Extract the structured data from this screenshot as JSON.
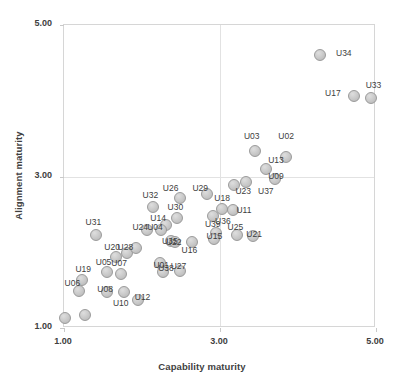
{
  "chart_data": {
    "type": "scatter",
    "title": "",
    "xlabel": "Capability maturity",
    "ylabel": "Alignment maturity",
    "xlim": [
      1.0,
      5.0
    ],
    "ylim": [
      1.0,
      5.0
    ],
    "xticks": [
      "1.00",
      "3.00",
      "5.00"
    ],
    "xtick_values": [
      1.0,
      3.0,
      5.0
    ],
    "yticks": [
      "1.00",
      "3.00",
      "5.00"
    ],
    "ytick_values": [
      1.0,
      3.0,
      5.0
    ],
    "grid": true,
    "legend": "none",
    "point_color": "#c9c9c9",
    "point_border_color": "#9a9a9a",
    "label_color": "#3d3d3d",
    "axis_color": "#d6d6d6",
    "points": [
      {
        "label": "U34",
        "x": 4.29,
        "y": 4.59,
        "lx": 4.6,
        "ly": 4.62
      },
      {
        "label": "U17",
        "x": 4.73,
        "y": 4.05,
        "lx": 4.46,
        "ly": 4.09
      },
      {
        "label": "U33",
        "x": 4.95,
        "y": 4.02,
        "lx": 4.98,
        "ly": 4.2
      },
      {
        "label": "U03",
        "x": 3.46,
        "y": 3.32,
        "lx": 3.42,
        "ly": 3.52
      },
      {
        "label": "U02",
        "x": 3.86,
        "y": 3.25,
        "lx": 3.86,
        "ly": 3.52
      },
      {
        "label": "U13",
        "x": 3.6,
        "y": 3.08,
        "lx": 3.73,
        "ly": 3.21
      },
      {
        "label": "U23",
        "x": 3.35,
        "y": 2.92,
        "lx": 3.31,
        "ly": 2.8
      },
      {
        "label": "U37",
        "x": 3.19,
        "y": 2.88,
        "lx": 3.6,
        "ly": 2.8
      },
      {
        "label": "U09",
        "x": 3.72,
        "y": 2.96,
        "lx": 3.73,
        "ly": 3.0
      },
      {
        "label": "U26",
        "x": 2.5,
        "y": 2.7,
        "lx": 2.38,
        "ly": 2.84
      },
      {
        "label": "U29",
        "x": 2.85,
        "y": 2.76,
        "lx": 2.76,
        "ly": 2.84
      },
      {
        "label": "U32",
        "x": 2.15,
        "y": 2.58,
        "lx": 2.12,
        "ly": 2.74
      },
      {
        "label": "U18",
        "x": 3.04,
        "y": 2.56,
        "lx": 3.04,
        "ly": 2.7
      },
      {
        "label": "U11",
        "x": 3.18,
        "y": 2.55,
        "lx": 3.32,
        "ly": 2.55
      },
      {
        "label": "U36",
        "x": 2.92,
        "y": 2.46,
        "lx": 3.05,
        "ly": 2.4
      },
      {
        "label": "U30",
        "x": 2.46,
        "y": 2.44,
        "lx": 2.44,
        "ly": 2.58
      },
      {
        "label": "U14",
        "x": 2.32,
        "y": 2.35,
        "lx": 2.22,
        "ly": 2.44
      },
      {
        "label": "U24",
        "x": 2.08,
        "y": 2.28,
        "lx": 1.99,
        "ly": 2.32
      },
      {
        "label": "U04",
        "x": 2.26,
        "y": 2.28,
        "lx": 2.18,
        "ly": 2.32
      },
      {
        "label": "U39",
        "x": 2.96,
        "y": 2.24,
        "lx": 2.92,
        "ly": 2.36
      },
      {
        "label": "U25",
        "x": 3.23,
        "y": 2.22,
        "lx": 3.21,
        "ly": 2.32
      },
      {
        "label": "U15",
        "x": 2.93,
        "y": 2.16,
        "lx": 2.94,
        "ly": 2.2
      },
      {
        "label": "U21",
        "x": 3.44,
        "y": 2.2,
        "lx": 3.45,
        "ly": 2.23
      },
      {
        "label": "U35",
        "x": 2.38,
        "y": 2.14,
        "lx": 2.37,
        "ly": 2.14
      },
      {
        "label": "U22",
        "x": 2.44,
        "y": 2.12,
        "lx": 2.42,
        "ly": 2.12
      },
      {
        "label": "U16",
        "x": 2.65,
        "y": 2.12,
        "lx": 2.62,
        "ly": 2.02
      },
      {
        "label": "U31",
        "x": 1.42,
        "y": 2.22,
        "lx": 1.39,
        "ly": 2.38
      },
      {
        "label": "U20",
        "x": 1.68,
        "y": 1.92,
        "lx": 1.63,
        "ly": 2.06
      },
      {
        "label": "U28",
        "x": 1.82,
        "y": 1.98,
        "lx": 1.8,
        "ly": 2.06
      },
      {
        "label": "U02b",
        "x": 1.94,
        "y": 2.04,
        "lx": 1.94,
        "ly": 2.04
      },
      {
        "label": "U38",
        "x": 2.24,
        "y": 1.84,
        "lx": 2.32,
        "ly": 1.78
      },
      {
        "label": "U05",
        "x": 1.56,
        "y": 1.72,
        "lx": 1.52,
        "ly": 1.86
      },
      {
        "label": "U07",
        "x": 1.74,
        "y": 1.7,
        "lx": 1.72,
        "ly": 1.84
      },
      {
        "label": "U01",
        "x": 2.28,
        "y": 1.72,
        "lx": 2.26,
        "ly": 1.82
      },
      {
        "label": "U27",
        "x": 2.5,
        "y": 1.74,
        "lx": 2.48,
        "ly": 1.8
      },
      {
        "label": "U19",
        "x": 1.24,
        "y": 1.62,
        "lx": 1.26,
        "ly": 1.76
      },
      {
        "label": "U06",
        "x": 1.2,
        "y": 1.48,
        "lx": 1.12,
        "ly": 1.58
      },
      {
        "label": "U08",
        "x": 1.56,
        "y": 1.46,
        "lx": 1.54,
        "ly": 1.5
      },
      {
        "label": "U12",
        "x": 1.96,
        "y": 1.36,
        "lx": 2.02,
        "ly": 1.4
      },
      {
        "label": "U10",
        "x": 1.78,
        "y": 1.46,
        "lx": 1.74,
        "ly": 1.32
      },
      {
        "label": "U03b",
        "x": 1.28,
        "y": 1.16,
        "lx": 1.28,
        "ly": 1.16
      },
      {
        "label": "U00",
        "x": 1.02,
        "y": 1.12,
        "lx": 1.02,
        "ly": 1.12
      }
    ]
  }
}
